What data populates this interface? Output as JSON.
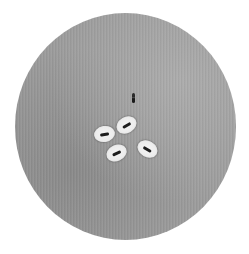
{
  "image": {
    "description": "Micrograph of capsule-stained bacteria: circular microscope field with grey background, four encapsulated rod-shaped bacteria showing clear halos, and one unencapsulated dark rod",
    "field": {
      "shape": "circle",
      "background_color": "#9c9c9c",
      "center": [
        125.5,
        126.5
      ],
      "diameter": [
        221,
        227
      ]
    },
    "colors": {
      "page": "#ffffff",
      "halo": "#ececec",
      "rod": "#1e1e1e"
    },
    "cells": [
      {
        "id": "cell-left",
        "x": 104,
        "y": 134,
        "rotation": -10
      },
      {
        "id": "cell-top",
        "x": 126,
        "y": 125,
        "rotation": -30
      },
      {
        "id": "cell-bottom",
        "x": 116,
        "y": 153,
        "rotation": -25
      },
      {
        "id": "cell-right",
        "x": 147,
        "y": 149,
        "rotation": 30
      }
    ],
    "free_rod": {
      "x": 133,
      "y": 98,
      "orientation": "vertical"
    }
  }
}
